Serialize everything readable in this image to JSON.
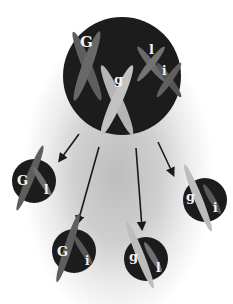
{
  "diagram": {
    "colors": {
      "cell": "#1c1c1c",
      "chromosome_G": "#5e5e5e",
      "chromosome_g": "#b8b8b8",
      "chromosome_I": "#6f6f6f",
      "chromosome_i": "#5a5a5a",
      "arrow": "#1a1a1a",
      "label": "#f2f2f2"
    },
    "parent_cell": {
      "labels": {
        "G": "G",
        "g": "g",
        "I": "l",
        "i": "i"
      }
    },
    "gametes": [
      {
        "id": "GI",
        "left_label": "G",
        "right_label": "l"
      },
      {
        "id": "Gi",
        "left_label": "G",
        "right_label": "i"
      },
      {
        "id": "gI",
        "left_label": "g",
        "right_label": "l"
      },
      {
        "id": "gi",
        "left_label": "g",
        "right_label": "i"
      }
    ],
    "arrows_count": 4
  }
}
